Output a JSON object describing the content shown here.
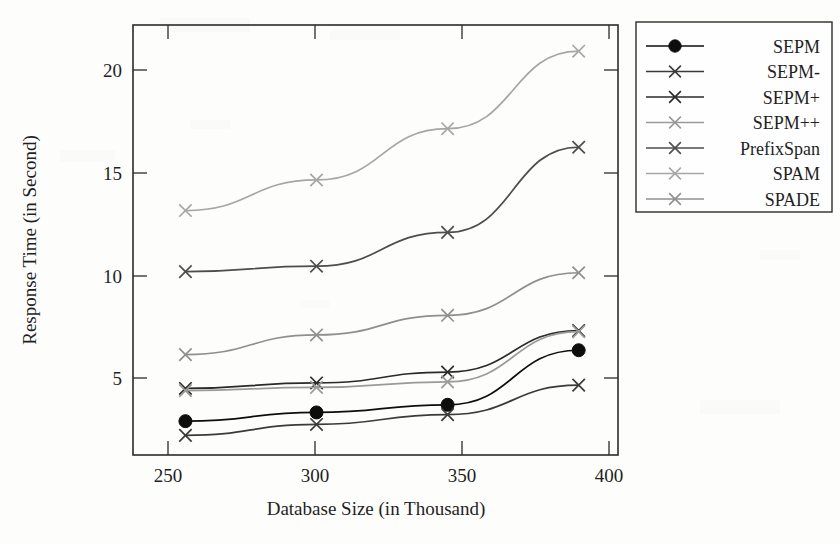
{
  "chart_data": {
    "type": "line",
    "title": "",
    "xlabel": "Database Size (in Thousand)",
    "ylabel": "Response Time (in Second)",
    "x": [
      250,
      300,
      350,
      400
    ],
    "categories": [
      "250",
      "300",
      "350",
      "400"
    ],
    "xticklabels": [
      "250",
      "300",
      "350",
      "400"
    ],
    "yticklabels": [
      "5",
      "10",
      "15",
      "20"
    ],
    "yticks": [
      5,
      10,
      15,
      20
    ],
    "xlim": [
      230,
      415
    ],
    "ylim": [
      1.9,
      21.6
    ],
    "grid": false,
    "legend_position": "right-outside",
    "series": [
      {
        "name": "SEPM",
        "marker": "circle",
        "color": "#0d0d0d",
        "values": [
          3.45,
          3.85,
          4.2,
          6.7
        ]
      },
      {
        "name": "SEPM-",
        "marker": "x",
        "color": "#3a3a3a",
        "values": [
          2.8,
          3.3,
          3.75,
          5.1
        ]
      },
      {
        "name": "SEPM+",
        "marker": "x",
        "color": "#2a2a2a",
        "values": [
          4.95,
          5.2,
          5.7,
          7.6
        ]
      },
      {
        "name": "SEPM++",
        "marker": "x",
        "color": "#9a9a9a",
        "values": [
          4.85,
          5.0,
          5.25,
          7.55
        ]
      },
      {
        "name": "PrefixSpan",
        "marker": "x",
        "color": "#4d4d4d",
        "values": [
          10.3,
          10.55,
          12.1,
          16.0
        ]
      },
      {
        "name": "SPAM",
        "marker": "x",
        "color": "#a6a6a6",
        "values": [
          13.1,
          14.5,
          16.85,
          20.4
        ]
      },
      {
        "name": "SPADE",
        "marker": "x",
        "color": "#8f8f8f",
        "values": [
          6.5,
          7.4,
          8.3,
          10.25
        ]
      }
    ]
  },
  "legend": {
    "entries": [
      {
        "label": "SEPM"
      },
      {
        "label": "SEPM-"
      },
      {
        "label": "SEPM+"
      },
      {
        "label": "SEPM++"
      },
      {
        "label": "PrefixSpan"
      },
      {
        "label": "SPAM"
      },
      {
        "label": "SPADE"
      }
    ]
  }
}
